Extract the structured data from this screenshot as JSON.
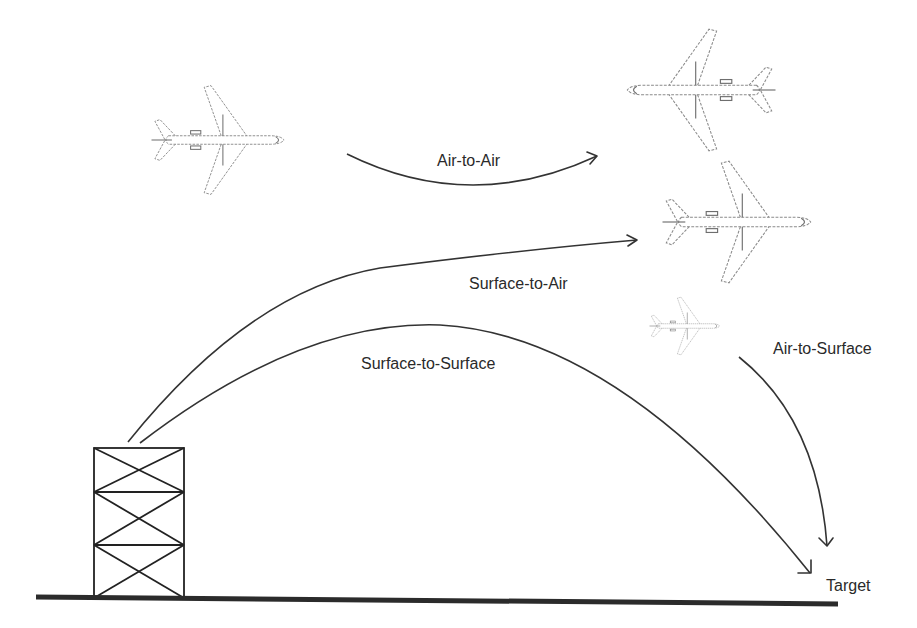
{
  "diagram": {
    "labels": {
      "air_to_air": "Air-to-Air",
      "surface_to_air": "Surface-to-Air",
      "surface_to_surface": "Surface-to-Surface",
      "air_to_surface": "Air-to-Surface",
      "target": "Target"
    },
    "elements": {
      "launch_tower": "launch-tower",
      "ground_line": "ground",
      "aircraft": [
        {
          "id": "aircraft-left",
          "heading": "right"
        },
        {
          "id": "aircraft-top-right",
          "heading": "left"
        },
        {
          "id": "aircraft-middle-right",
          "heading": "right"
        },
        {
          "id": "aircraft-small-right",
          "heading": "right"
        }
      ]
    },
    "colors": {
      "line": "#333333",
      "ground": "#2b2b2b",
      "aircraft_outline": "#8a8a8a",
      "background": "#ffffff"
    }
  }
}
